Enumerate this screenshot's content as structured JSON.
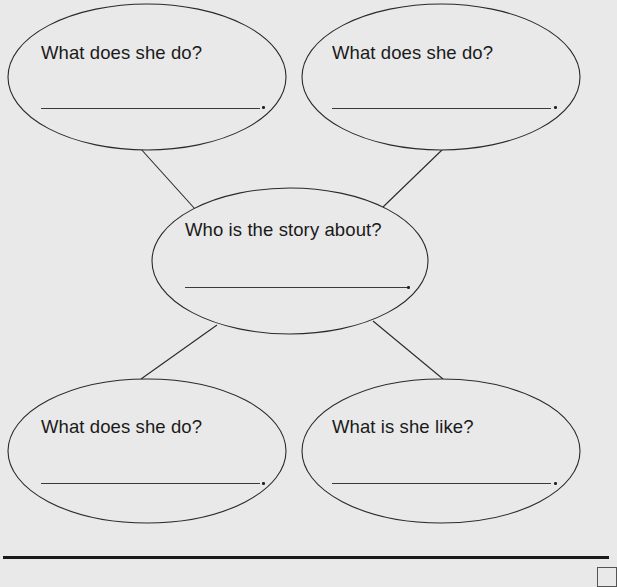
{
  "diagram": {
    "type": "story-web",
    "colors": {
      "background": "#e9e9e9",
      "stroke": "#2a2a2a",
      "text": "#1a1a1a"
    },
    "center": {
      "question": "Who is the story about?",
      "answer": "",
      "answer_suffix": "."
    },
    "bubbles": [
      {
        "position": "top-left",
        "question": "What does she do?",
        "answer": "",
        "answer_suffix": "."
      },
      {
        "position": "top-right",
        "question": "What does she do?",
        "answer": "",
        "answer_suffix": "."
      },
      {
        "position": "bottom-left",
        "question": "What does she do?",
        "answer": "",
        "answer_suffix": "."
      },
      {
        "position": "bottom-right",
        "question": "What is she like?",
        "answer": "",
        "answer_suffix": "."
      }
    ],
    "connectors": [
      {
        "from": "center",
        "to": "top-left"
      },
      {
        "from": "center",
        "to": "top-right"
      },
      {
        "from": "center",
        "to": "bottom-left"
      },
      {
        "from": "center",
        "to": "bottom-right"
      }
    ]
  }
}
